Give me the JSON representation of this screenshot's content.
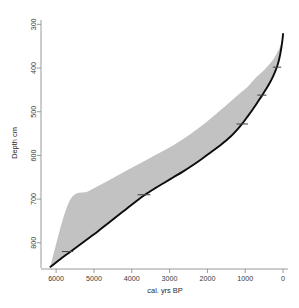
{
  "figure": {
    "kind": "age-depth-model",
    "ghost_header": "",
    "background": "#ffffff",
    "median_color": "#0d0d0d",
    "band_color": "#8f8f8f",
    "axis_color": "#8e8e8e"
  },
  "chart_data": {
    "type": "line",
    "title": "",
    "xlabel": "cal. yrs BP",
    "ylabel": "Depth cm",
    "xlim": [
      6400,
      -130
    ],
    "ylim": [
      860,
      290
    ],
    "x_reversed": true,
    "y_reversed": true,
    "grid": false,
    "legend": null,
    "xticks": [
      6000,
      5000,
      4000,
      3000,
      2000,
      1000,
      0
    ],
    "xtick_labels": [
      "6000",
      "5000",
      "4000",
      "3000",
      "2000",
      "1000",
      "0"
    ],
    "yticks": [
      300,
      400,
      500,
      600,
      700,
      800
    ],
    "ytick_labels": [
      "300",
      "400",
      "500",
      "600",
      "700",
      "800"
    ],
    "series": [
      {
        "name": "median age-depth model",
        "x": [
          6150,
          5900,
          5650,
          5400,
          5150,
          4900,
          4650,
          4400,
          4150,
          3900,
          3650,
          3400,
          3150,
          2900,
          2650,
          2400,
          2150,
          1900,
          1650,
          1400,
          1200,
          1050,
          930,
          830,
          740,
          660,
          580,
          500,
          420,
          340,
          265,
          200,
          150,
          110,
          75,
          45,
          20,
          0
        ],
        "y": [
          855,
          838,
          822,
          806,
          790,
          774,
          757,
          740,
          723,
          706,
          690,
          676,
          663,
          650,
          637,
          623,
          608,
          592,
          576,
          558,
          540,
          524,
          510,
          498,
          487,
          476,
          466,
          455,
          444,
          432,
          419,
          406,
          394,
          382,
          368,
          353,
          338,
          322
        ]
      },
      {
        "name": "upper 95% uncertainty bound",
        "x": [
          6150,
          5650,
          5150,
          4650,
          4150,
          3650,
          3150,
          2650,
          2150,
          1650,
          1200,
          930,
          740,
          580,
          420,
          265,
          150,
          75,
          20,
          0
        ],
        "y": [
          857,
          824,
          792,
          759,
          725,
          692,
          665,
          639,
          610,
          578,
          542,
          512,
          489,
          468,
          446,
          421,
          396,
          370,
          340,
          323
        ]
      },
      {
        "name": "lower 95% uncertainty bound",
        "x": [
          0,
          20,
          75,
          150,
          265,
          420,
          580,
          740,
          930,
          1200,
          1650,
          2150,
          2650,
          3150,
          3650,
          4150,
          4650,
          5150,
          5650,
          6150
        ],
        "y": [
          321,
          336,
          350,
          364,
          381,
          397,
          411,
          424,
          442,
          462,
          496,
          532,
          563,
          589,
          612,
          635,
          659,
          682,
          705,
          853
        ]
      }
    ],
    "date_markers": [
      {
        "x": 5700,
        "y": 820,
        "half_width_years": 150,
        "label": ""
      },
      {
        "x": 3680,
        "y": 690,
        "half_width_years": 170,
        "label": ""
      },
      {
        "x": 1080,
        "y": 528,
        "half_width_years": 150,
        "label": ""
      },
      {
        "x": 560,
        "y": 462,
        "half_width_years": 120,
        "label": ""
      },
      {
        "x": 160,
        "y": 398,
        "half_width_years": 110,
        "label": ""
      }
    ]
  }
}
